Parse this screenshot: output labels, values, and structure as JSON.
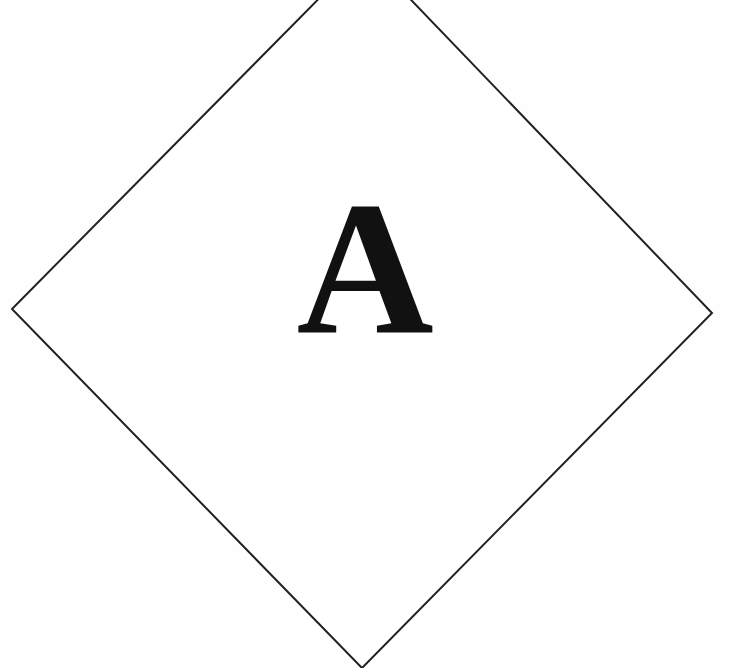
{
  "diagram": {
    "type": "diamond-sign",
    "shape": "diamond",
    "label": "A",
    "stroke_color": "#222222",
    "fill_color": "#ffffff",
    "vertices": {
      "top": [
        365,
        -48
      ],
      "right": [
        712,
        313
      ],
      "bottom": [
        362,
        668
      ],
      "left": [
        12,
        309
      ]
    }
  }
}
